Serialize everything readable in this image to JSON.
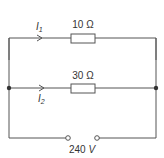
{
  "diagram": {
    "type": "parallel-circuit",
    "branches": [
      {
        "name": "upper",
        "resistor_label": "10 Ω",
        "current_label": "I",
        "current_sub": "1"
      },
      {
        "name": "lower",
        "resistor_label": "30 Ω",
        "current_label": "I",
        "current_sub": "2"
      }
    ],
    "source": {
      "label": "240 V",
      "value": "240",
      "unit": "V"
    },
    "colors": {
      "wire": "#555555",
      "text": "#333333",
      "background": "#ffffff"
    }
  }
}
